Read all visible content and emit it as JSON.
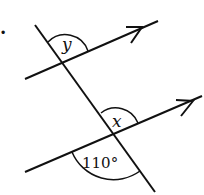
{
  "diagram": {
    "question_marker": ".",
    "angles": {
      "upper": {
        "label": "y"
      },
      "lower_top": {
        "label": "x"
      },
      "lower_bottom": {
        "label": "110°"
      }
    },
    "lines": {
      "transversal": {
        "from": [
          35,
          25
        ],
        "to": [
          155,
          192
        ]
      },
      "parallel_upper": {
        "from": [
          25,
          79
        ],
        "to": [
          158,
          21
        ],
        "arrow": true
      },
      "parallel_lower": {
        "from": [
          25,
          172
        ],
        "to": [
          202,
          96
        ],
        "arrow": true
      }
    },
    "colors": {
      "stroke": "#111111",
      "background": "#ffffff"
    }
  }
}
